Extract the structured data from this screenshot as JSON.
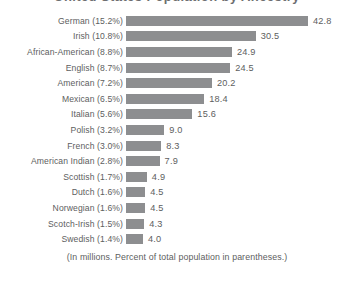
{
  "chart_data": {
    "type": "bar",
    "orientation": "horizontal",
    "title": "United States Population by Ancestry",
    "footnote": "(In millions. Percent of total population in parentheses.)",
    "xlabel": "",
    "ylabel": "",
    "xlim": [
      0,
      42.8
    ],
    "grid": false,
    "legend": null,
    "bar_color": "#8d8e90",
    "text_color": "#5d5e60",
    "categories": [
      "German (15.2%)",
      "Irish (10.8%)",
      "African-American (8.8%)",
      "English (8.7%)",
      "American (7.2%)",
      "Mexican (6.5%)",
      "Italian (5.6%)",
      "Polish (3.2%)",
      "French (3.0%)",
      "American Indian (2.8%)",
      "Scottish (1.7%)",
      "Dutch (1.6%)",
      "Norwegian (1.6%)",
      "Scotch-Irish (1.5%)",
      "Swedish (1.4%)"
    ],
    "values": [
      42.8,
      30.5,
      24.9,
      24.5,
      20.2,
      18.4,
      15.6,
      9.0,
      8.3,
      7.9,
      4.9,
      4.5,
      4.5,
      4.3,
      4.0
    ],
    "value_labels": [
      "42.8",
      "30.5",
      "24.9",
      "24.5",
      "20.2",
      "18.4",
      "15.6",
      "9.0",
      "8.3",
      "7.9",
      "4.9",
      "4.5",
      "4.5",
      "4.3",
      "4.0"
    ],
    "percent_labels": [
      "15.2%",
      "10.8%",
      "8.8%",
      "8.7%",
      "7.2%",
      "6.5%",
      "5.6%",
      "3.2%",
      "3.0%",
      "2.8%",
      "1.7%",
      "1.6%",
      "1.6%",
      "1.5%",
      "1.4%"
    ],
    "group_names": [
      "German",
      "Irish",
      "African-American",
      "English",
      "American",
      "Mexican",
      "Italian",
      "Polish",
      "French",
      "American Indian",
      "Scottish",
      "Dutch",
      "Norwegian",
      "Scotch-Irish",
      "Swedish"
    ]
  }
}
